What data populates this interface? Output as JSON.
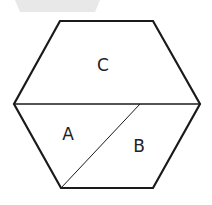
{
  "diagram": {
    "shape": "hexagon",
    "regions": [
      {
        "label": "C"
      },
      {
        "label": "A"
      },
      {
        "label": "B"
      }
    ],
    "colors": {
      "stroke": "#1a1a1a",
      "fill": "#ffffff",
      "faded_shape": "#e6e6e6"
    }
  }
}
